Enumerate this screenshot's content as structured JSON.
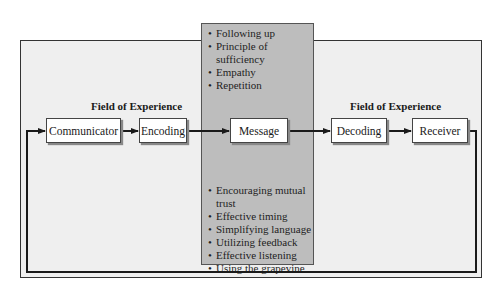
{
  "diagram": {
    "type": "communication-process-flow",
    "fields_of_experience": [
      {
        "label": "Field of Experience",
        "side": "sender"
      },
      {
        "label": "Field of Experience",
        "side": "receiver"
      }
    ],
    "nodes": [
      {
        "id": "communicator",
        "label": "Communicator"
      },
      {
        "id": "encoding",
        "label": "Encoding"
      },
      {
        "id": "message",
        "label": "Message"
      },
      {
        "id": "decoding",
        "label": "Decoding"
      },
      {
        "id": "receiver",
        "label": "Receiver"
      }
    ],
    "edges": [
      {
        "from": "communicator",
        "to": "encoding"
      },
      {
        "from": "encoding",
        "to": "message"
      },
      {
        "from": "message",
        "to": "decoding"
      },
      {
        "from": "decoding",
        "to": "receiver"
      },
      {
        "from": "receiver",
        "to": "communicator",
        "kind": "feedback-loop"
      }
    ],
    "message_panel": {
      "top_items": [
        "Following up",
        "Principle of sufficiency",
        "Empathy",
        "Repetition"
      ],
      "bottom_items": [
        "Encouraging mutual trust",
        "Effective timing",
        "Simplifying language",
        "Utilizing feedback",
        "Effective listening",
        "Using the grapevine"
      ]
    },
    "colors": {
      "frame_bg": "#efefef",
      "panel_bg": "#bdbdbd",
      "box_bg": "#ffffff",
      "line": "#1a1a1a"
    }
  }
}
